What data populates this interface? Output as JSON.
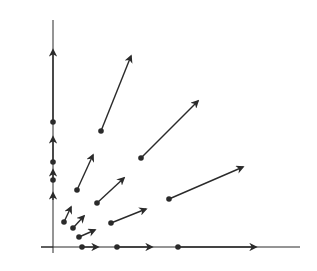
{
  "diagram": {
    "title": "",
    "type": "vector-field",
    "colors": {
      "ink": "#2a2a2a",
      "background": "#ffffff"
    },
    "axes": {
      "origin": [
        53,
        247
      ],
      "x_end": [
        300,
        247
      ],
      "y_end": [
        53,
        20
      ]
    },
    "vectors": [
      {
        "from": [
          53,
          122
        ],
        "to": [
          53,
          50
        ],
        "dot": true
      },
      {
        "from": [
          53,
          162
        ],
        "to": [
          53,
          137
        ],
        "dot": true
      },
      {
        "from": [
          53,
          180
        ],
        "to": [
          53,
          170
        ],
        "dot": true
      },
      {
        "from": [
          53,
          200
        ],
        "to": [
          53,
          193
        ],
        "dot": false
      },
      {
        "from": [
          82,
          247
        ],
        "to": [
          98,
          247
        ],
        "dot": true
      },
      {
        "from": [
          117,
          247
        ],
        "to": [
          152,
          247
        ],
        "dot": true
      },
      {
        "from": [
          178,
          247
        ],
        "to": [
          256,
          247
        ],
        "dot": true
      },
      {
        "from": [
          101,
          131
        ],
        "to": [
          131,
          56
        ],
        "dot": true
      },
      {
        "from": [
          141,
          158
        ],
        "to": [
          198,
          101
        ],
        "dot": true
      },
      {
        "from": [
          169,
          199
        ],
        "to": [
          243,
          167
        ],
        "dot": true
      },
      {
        "from": [
          77,
          190
        ],
        "to": [
          93,
          155
        ],
        "dot": true
      },
      {
        "from": [
          97,
          203
        ],
        "to": [
          124,
          178
        ],
        "dot": true
      },
      {
        "from": [
          111,
          223
        ],
        "to": [
          146,
          209
        ],
        "dot": true
      },
      {
        "from": [
          64,
          222
        ],
        "to": [
          71,
          207
        ],
        "dot": true
      },
      {
        "from": [
          73,
          228
        ],
        "to": [
          84,
          216
        ],
        "dot": true
      },
      {
        "from": [
          79,
          237
        ],
        "to": [
          95,
          230
        ],
        "dot": true
      }
    ]
  }
}
